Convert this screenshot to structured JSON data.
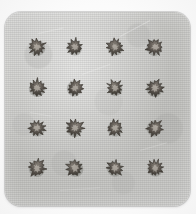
{
  "image": {
    "kind": "photograph",
    "palette": "grayscale",
    "subject_label": "specimen-plate",
    "background_color": "#fdfdfd",
    "plate_color": "#c9c9c6",
    "plate_highlight_color": "#d8d8d6",
    "specimen_color": "#5a544e",
    "specimen_core_color": "#8a837b",
    "specimen_shadow_color": "#3c3832"
  },
  "plate": {
    "name": "textured-square-plate",
    "left": 5,
    "top": 12,
    "width": 185,
    "height": 194,
    "corner_radius": 16,
    "texture": "fine-woven-grain"
  },
  "grid": {
    "name": "specimen-grid",
    "rows": 4,
    "columns": 4,
    "count": 16,
    "column_centers_x": [
      37,
      75,
      115,
      155
    ],
    "row_centers_y": [
      47,
      88,
      128,
      168
    ],
    "specimen_diameter": 20
  },
  "specimens": [
    {
      "id": "r1c1",
      "row": 1,
      "col": 1,
      "cx": 37,
      "cy": 47,
      "size": 21,
      "rotation": 8,
      "spikes": 11
    },
    {
      "id": "r1c2",
      "row": 1,
      "col": 2,
      "cx": 75,
      "cy": 47,
      "size": 20,
      "rotation": 46,
      "spikes": 11
    },
    {
      "id": "r1c3",
      "row": 1,
      "col": 3,
      "cx": 115,
      "cy": 47,
      "size": 20,
      "rotation": 22,
      "spikes": 12
    },
    {
      "id": "r1c4",
      "row": 1,
      "col": 4,
      "cx": 155,
      "cy": 47,
      "size": 21,
      "rotation": 64,
      "spikes": 11
    },
    {
      "id": "r2c1",
      "row": 2,
      "col": 1,
      "cx": 37,
      "cy": 88,
      "size": 21,
      "rotation": 33,
      "spikes": 12
    },
    {
      "id": "r2c2",
      "row": 2,
      "col": 2,
      "cx": 75,
      "cy": 88,
      "size": 20,
      "rotation": 72,
      "spikes": 11
    },
    {
      "id": "r2c3",
      "row": 2,
      "col": 3,
      "cx": 115,
      "cy": 88,
      "size": 19,
      "rotation": 14,
      "spikes": 11
    },
    {
      "id": "r2c4",
      "row": 2,
      "col": 4,
      "cx": 155,
      "cy": 88,
      "size": 21,
      "rotation": 55,
      "spikes": 12
    },
    {
      "id": "r3c1",
      "row": 3,
      "col": 1,
      "cx": 37,
      "cy": 128,
      "size": 20,
      "rotation": 18,
      "spikes": 11
    },
    {
      "id": "r3c2",
      "row": 3,
      "col": 2,
      "cx": 75,
      "cy": 128,
      "size": 21,
      "rotation": 60,
      "spikes": 12
    },
    {
      "id": "r3c3",
      "row": 3,
      "col": 3,
      "cx": 115,
      "cy": 128,
      "size": 20,
      "rotation": 28,
      "spikes": 11
    },
    {
      "id": "r3c4",
      "row": 3,
      "col": 4,
      "cx": 155,
      "cy": 128,
      "size": 20,
      "rotation": 78,
      "spikes": 11
    },
    {
      "id": "r4c1",
      "row": 4,
      "col": 1,
      "cx": 37,
      "cy": 168,
      "size": 21,
      "rotation": 40,
      "spikes": 12
    },
    {
      "id": "r4c2",
      "row": 4,
      "col": 2,
      "cx": 75,
      "cy": 168,
      "size": 21,
      "rotation": 6,
      "spikes": 11
    },
    {
      "id": "r4c3",
      "row": 4,
      "col": 3,
      "cx": 115,
      "cy": 168,
      "size": 20,
      "rotation": 52,
      "spikes": 11
    },
    {
      "id": "r4c4",
      "row": 4,
      "col": 4,
      "cx": 155,
      "cy": 168,
      "size": 20,
      "rotation": 25,
      "spikes": 12
    }
  ],
  "scratches": [
    {
      "x": 38,
      "y": 33,
      "length": 26,
      "angle": -12,
      "opacity": 0.45
    },
    {
      "x": 120,
      "y": 36,
      "length": 34,
      "angle": -28,
      "opacity": 0.5
    },
    {
      "x": 82,
      "y": 74,
      "length": 30,
      "angle": -20,
      "opacity": 0.4
    },
    {
      "x": 30,
      "y": 112,
      "length": 22,
      "angle": 10,
      "opacity": 0.35
    },
    {
      "x": 140,
      "y": 150,
      "length": 28,
      "angle": -16,
      "opacity": 0.35
    },
    {
      "x": 60,
      "y": 190,
      "length": 40,
      "angle": -4,
      "opacity": 0.3
    }
  ]
}
